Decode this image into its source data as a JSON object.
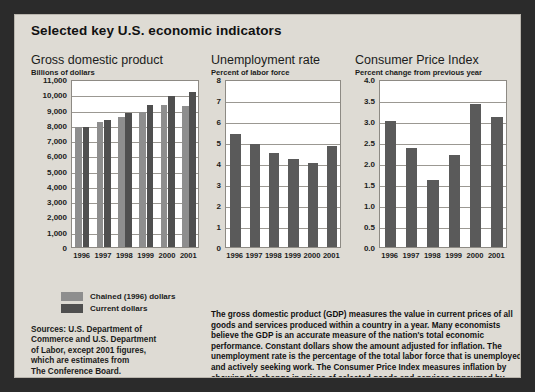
{
  "headline": "Selected key U.S. economic indicators",
  "legend": {
    "items": [
      {
        "label": "Chained (1996) dollars",
        "color": "#8e8e8e",
        "key": "chained"
      },
      {
        "label": "Current dollars",
        "color": "#4f4f4f",
        "key": "current"
      }
    ]
  },
  "sources": {
    "lines": [
      "Sources: U.S. Department of",
      "Commerce and U.S. Department",
      "of Labor, except 2001 figures,",
      "which are estimates from",
      "The Conference Board."
    ]
  },
  "blurb": {
    "text": "The gross domestic product (GDP) measures the value in current prices of all goods and services produced within a country in a year. Many economists believe the GDP is an accurate measure of the nation's total economic performance. Constant dollars show the amount adjusted for inflation. The unemployment rate is the percentage of the total labor force that is unemployed and actively seeking work. The Consumer Price Index measures inflation by showing the change in prices of selected goods and services consumed by urban families and individuals."
  },
  "chart_data": [
    {
      "type": "bar",
      "id": "gdp",
      "title": "Gross domestic product",
      "subtitle": "Billions of dollars",
      "xlabel": "",
      "ylabel": "Billions of dollars",
      "categories": [
        "1996",
        "1997",
        "1998",
        "1999",
        "2000",
        "2001"
      ],
      "series": [
        {
          "name": "Chained (1996) dollars",
          "color": "#8e8e8e",
          "values": [
            7840,
            8160,
            8510,
            8860,
            9320,
            9250
          ]
        },
        {
          "name": "Current dollars",
          "color": "#4f4f4f",
          "values": [
            7840,
            8300,
            8790,
            9270,
            9870,
            10120
          ]
        }
      ],
      "ylim": [
        0,
        11000
      ],
      "yticks": [
        0,
        1000,
        2000,
        3000,
        4000,
        5000,
        6000,
        7000,
        8000,
        9000,
        10000,
        11000
      ],
      "yticklabels": [
        "0",
        "1,000",
        "2,000",
        "3,000",
        "4,000",
        "5,000",
        "6,000",
        "7,000",
        "8,000",
        "9,000",
        "10,000",
        "11,000"
      ],
      "grid": true,
      "legend_position": "below"
    },
    {
      "type": "bar",
      "id": "unemployment",
      "title": "Unemployment rate",
      "subtitle": "Percent of labor force",
      "xlabel": "",
      "ylabel": "Percent of labor force",
      "categories": [
        "1996",
        "1997",
        "1998",
        "1999",
        "2000",
        "2001"
      ],
      "series": [
        {
          "name": "Unemployment rate",
          "color": "#5a5a5a",
          "values": [
            5.4,
            4.9,
            4.5,
            4.2,
            4.0,
            4.8
          ]
        }
      ],
      "ylim": [
        0,
        8
      ],
      "yticks": [
        0,
        1,
        2,
        3,
        4,
        5,
        6,
        7,
        8
      ],
      "yticklabels": [
        "0",
        "1",
        "2",
        "3",
        "4",
        "5",
        "6",
        "7",
        "8"
      ],
      "grid": true,
      "legend_position": "none"
    },
    {
      "type": "bar",
      "id": "cpi",
      "title": "Consumer Price Index",
      "subtitle": "Percent change from previous year",
      "xlabel": "",
      "ylabel": "Percent change from previous year",
      "categories": [
        "1996",
        "1997",
        "1998",
        "1999",
        "2000",
        "2001"
      ],
      "series": [
        {
          "name": "Consumer Price Index",
          "color": "#5a5a5a",
          "values": [
            3.0,
            2.35,
            1.6,
            2.2,
            3.4,
            3.1
          ]
        }
      ],
      "ylim": [
        0,
        4.0
      ],
      "yticks": [
        0.0,
        0.5,
        1.0,
        1.5,
        2.0,
        2.5,
        3.0,
        3.5,
        4.0
      ],
      "yticklabels": [
        "0.0",
        "0.5",
        "1.0",
        "1.5",
        "2.0",
        "2.5",
        "3.0",
        "3.5",
        "4.0"
      ],
      "grid": true,
      "legend_position": "none"
    }
  ]
}
